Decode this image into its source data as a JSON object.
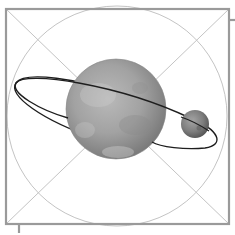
{
  "image": {
    "description": "Planet with orbiting moon icon inside a square frame with diagonals and inscribed circle",
    "icon": "planet-with-moon-icon"
  },
  "colors": {
    "background": "#ffffff",
    "frame": "#9a9a9a",
    "guides": "#c4c4c4",
    "orbit": "#1e1e1e",
    "planet_light": "#b8b8b8",
    "planet_mid": "#9c9c9c",
    "planet_dark": "#6e6e6e",
    "moon_light": "#a0a0a0",
    "moon_dark": "#555555"
  }
}
